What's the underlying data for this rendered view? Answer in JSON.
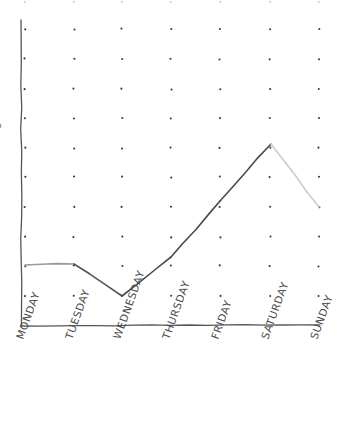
{
  "chart_data": {
    "type": "line",
    "title": "",
    "subtitle": "",
    "xlabel": "",
    "ylabel": "",
    "style": "hand-drawn",
    "grid": true,
    "grid_style": "dots",
    "legend": false,
    "legend_position": "none",
    "background_color": "#ffffff",
    "axis_color": "#555555",
    "grid_dot_color": "#3a3a3a",
    "categories": [
      "MONDAY",
      "TUESDAY",
      "WEDNESDAY",
      "THURSDAY",
      "FRIDAY",
      "SATURDAY",
      "SUNDAY"
    ],
    "values": [
      4.1,
      4.15,
      3.05,
      4.4,
      6.3,
      8.25,
      6.1
    ],
    "xlim": [
      0,
      6
    ],
    "ylim": [
      0,
      10
    ],
    "x_tick_labels": [
      "MONDAY",
      "TUESDAY",
      "WEDNESDAY",
      "THURSDAY",
      "FRIDAY",
      "SATURDAY",
      "SUNDAY"
    ],
    "y_tick_labels": [],
    "x_tick_rotation": -70,
    "series": [
      {
        "name": "series-1",
        "values": [
          4.1,
          4.15,
          3.05,
          4.4,
          6.3,
          8.25,
          6.1
        ],
        "segment_colors": [
          "#9a9a9a",
          "#555555",
          "#4a4a4a",
          "#4a4a4a",
          "#4a4a4a",
          "#cdcdcd"
        ],
        "stroke_width": 1.6
      }
    ],
    "points_px": [
      {
        "label": "MONDAY",
        "x": 25,
        "y": 265
      },
      {
        "label": "TUESDAY",
        "x": 74,
        "y": 264
      },
      {
        "label": "WEDNESDAY",
        "x": 122,
        "y": 296
      },
      {
        "label": "THURSDAY",
        "x": 171,
        "y": 257
      },
      {
        "label": "FRIDAY",
        "x": 220,
        "y": 201
      },
      {
        "label": "SATURDAY",
        "x": 271,
        "y": 144
      },
      {
        "label": "SUNDAY",
        "x": 319,
        "y": 207
      }
    ],
    "grid_dot_columns_px": [
      25,
      74,
      122,
      171,
      220,
      270,
      319
    ],
    "grid_dot_rows_px": [
      29,
      59,
      89,
      118,
      148,
      177,
      207,
      237,
      266,
      296
    ],
    "grid_dot_rows_faint_px": [
      2
    ],
    "axes_px": {
      "y_axis": {
        "x": 21,
        "y_top": 20,
        "y_bottom": 326
      },
      "x_axis": {
        "y": 326,
        "x_left": 21,
        "x_right": 320
      }
    },
    "annotations": [],
    "y_axis_label_clipped": "g"
  }
}
